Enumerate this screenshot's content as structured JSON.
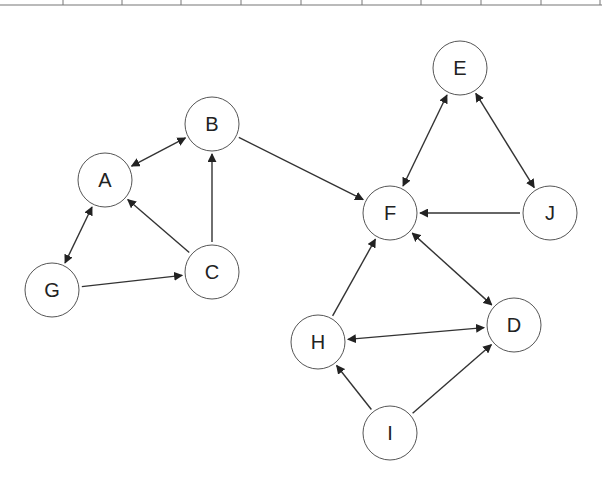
{
  "diagram": {
    "type": "directed-graph",
    "colors": {
      "edge": "#333333",
      "node_stroke": "#555555",
      "label": "#222222",
      "table_line": "#777777"
    },
    "table_fragment": {
      "line_y": 5,
      "dividers_x": [
        63,
        122,
        181,
        241,
        301,
        362,
        421,
        481,
        541,
        600
      ]
    },
    "node_radius": 27,
    "nodes": [
      {
        "id": "A",
        "label": "A",
        "x": 105,
        "y": 180
      },
      {
        "id": "B",
        "label": "B",
        "x": 212,
        "y": 124
      },
      {
        "id": "C",
        "label": "C",
        "x": 212,
        "y": 272
      },
      {
        "id": "G",
        "label": "G",
        "x": 52,
        "y": 290
      },
      {
        "id": "E",
        "label": "E",
        "x": 460,
        "y": 68
      },
      {
        "id": "F",
        "label": "F",
        "x": 390,
        "y": 213
      },
      {
        "id": "J",
        "label": "J",
        "x": 550,
        "y": 213
      },
      {
        "id": "H",
        "label": "H",
        "x": 318,
        "y": 342
      },
      {
        "id": "D",
        "label": "D",
        "x": 514,
        "y": 325
      },
      {
        "id": "I",
        "label": "I",
        "x": 390,
        "y": 433
      }
    ],
    "edges": [
      {
        "from": "A",
        "to": "B",
        "bidirectional": true
      },
      {
        "from": "A",
        "to": "G",
        "bidirectional": true
      },
      {
        "from": "C",
        "to": "A",
        "bidirectional": false
      },
      {
        "from": "C",
        "to": "B",
        "bidirectional": false
      },
      {
        "from": "G",
        "to": "C",
        "bidirectional": false
      },
      {
        "from": "B",
        "to": "F",
        "bidirectional": false
      },
      {
        "from": "E",
        "to": "F",
        "bidirectional": true
      },
      {
        "from": "E",
        "to": "J",
        "bidirectional": true
      },
      {
        "from": "J",
        "to": "F",
        "bidirectional": false
      },
      {
        "from": "F",
        "to": "D",
        "bidirectional": true
      },
      {
        "from": "H",
        "to": "F",
        "bidirectional": false
      },
      {
        "from": "H",
        "to": "D",
        "bidirectional": true
      },
      {
        "from": "I",
        "to": "H",
        "bidirectional": false
      },
      {
        "from": "I",
        "to": "D",
        "bidirectional": false
      }
    ]
  }
}
